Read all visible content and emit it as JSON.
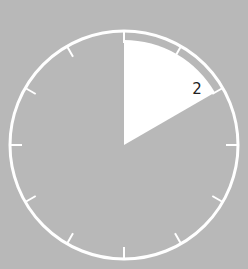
{
  "clock": {
    "background": "#b8b8b8",
    "ring_color": "#ffffff",
    "wedge_color": "#ffffff",
    "ticks": 12,
    "wedge_from_hour": 0,
    "wedge_to_hour": 2,
    "label": "2"
  }
}
